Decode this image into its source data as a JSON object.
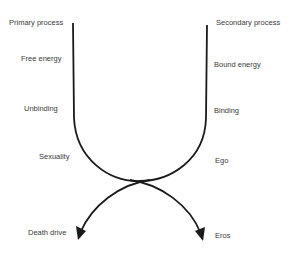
{
  "diagram": {
    "left_column": {
      "title": "Primary process",
      "items": [
        "Free energy",
        "Unbinding",
        "Sexuality"
      ],
      "outcome": "Death drive"
    },
    "right_column": {
      "title": "Secondary process",
      "items": [
        "Bound energy",
        "Binding",
        "Ego"
      ],
      "outcome": "Eros"
    },
    "line_color": "#1a1a1a"
  }
}
